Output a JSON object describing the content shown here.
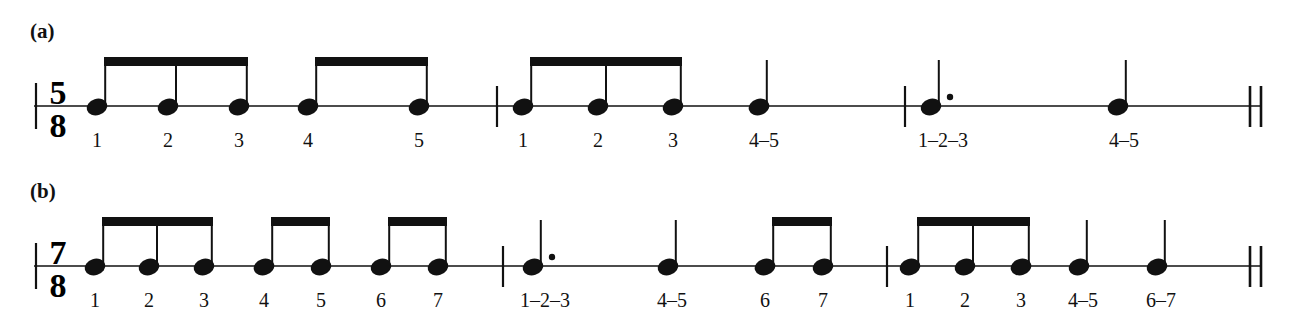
{
  "figure": {
    "background_color": "#ffffff",
    "ink_color": "#111111",
    "systems": [
      {
        "id": "a",
        "label": "(a)",
        "time_signature": {
          "numerator": "5",
          "denominator": "8"
        },
        "beat_grouping": "3+2",
        "measures": [
          {
            "index": 1,
            "notes": [
              {
                "type": "eighth",
                "beam_group": 1,
                "count_label": "1",
                "dotted": false
              },
              {
                "type": "eighth",
                "beam_group": 1,
                "count_label": "2",
                "dotted": false
              },
              {
                "type": "eighth",
                "beam_group": 1,
                "count_label": "3",
                "dotted": false
              },
              {
                "type": "eighth",
                "beam_group": 2,
                "count_label": "4",
                "dotted": false
              },
              {
                "type": "eighth",
                "beam_group": 2,
                "count_label": "5",
                "dotted": false
              }
            ]
          },
          {
            "index": 2,
            "notes": [
              {
                "type": "eighth",
                "beam_group": 3,
                "count_label": "1",
                "dotted": false
              },
              {
                "type": "eighth",
                "beam_group": 3,
                "count_label": "2",
                "dotted": false
              },
              {
                "type": "eighth",
                "beam_group": 3,
                "count_label": "3",
                "dotted": false
              },
              {
                "type": "quarter",
                "beam_group": null,
                "count_label": "4–5",
                "dotted": false
              }
            ]
          },
          {
            "index": 3,
            "notes": [
              {
                "type": "quarter",
                "beam_group": null,
                "count_label": "1–2–3",
                "dotted": true
              },
              {
                "type": "quarter",
                "beam_group": null,
                "count_label": "4–5",
                "dotted": false
              }
            ]
          }
        ],
        "final_barline": "double"
      },
      {
        "id": "b",
        "label": "(b)",
        "time_signature": {
          "numerator": "7",
          "denominator": "8"
        },
        "beat_grouping": "3+2+2",
        "measures": [
          {
            "index": 1,
            "notes": [
              {
                "type": "eighth",
                "beam_group": 1,
                "count_label": "1",
                "dotted": false
              },
              {
                "type": "eighth",
                "beam_group": 1,
                "count_label": "2",
                "dotted": false
              },
              {
                "type": "eighth",
                "beam_group": 1,
                "count_label": "3",
                "dotted": false
              },
              {
                "type": "eighth",
                "beam_group": 2,
                "count_label": "4",
                "dotted": false
              },
              {
                "type": "eighth",
                "beam_group": 2,
                "count_label": "5",
                "dotted": false
              },
              {
                "type": "eighth",
                "beam_group": 3,
                "count_label": "6",
                "dotted": false
              },
              {
                "type": "eighth",
                "beam_group": 3,
                "count_label": "7",
                "dotted": false
              }
            ]
          },
          {
            "index": 2,
            "notes": [
              {
                "type": "quarter",
                "beam_group": null,
                "count_label": "1–2–3",
                "dotted": true
              },
              {
                "type": "quarter",
                "beam_group": null,
                "count_label": "4–5",
                "dotted": false
              },
              {
                "type": "eighth",
                "beam_group": 4,
                "count_label": "6",
                "dotted": false
              },
              {
                "type": "eighth",
                "beam_group": 4,
                "count_label": "7",
                "dotted": false
              }
            ]
          },
          {
            "index": 3,
            "notes": [
              {
                "type": "eighth",
                "beam_group": 5,
                "count_label": "1",
                "dotted": false
              },
              {
                "type": "eighth",
                "beam_group": 5,
                "count_label": "2",
                "dotted": false
              },
              {
                "type": "eighth",
                "beam_group": 5,
                "count_label": "3",
                "dotted": false
              },
              {
                "type": "quarter",
                "beam_group": null,
                "count_label": "4–5",
                "dotted": false
              },
              {
                "type": "quarter",
                "beam_group": null,
                "count_label": "6–7",
                "dotted": false
              }
            ]
          }
        ],
        "final_barline": "double"
      }
    ]
  },
  "system_a": {
    "label": "(a)",
    "ts_num": "5",
    "ts_den": "8",
    "counts": {
      "m1n1": "1",
      "m1n2": "2",
      "m1n3": "3",
      "m1n4": "4",
      "m1n5": "5",
      "m2n1": "1",
      "m2n2": "2",
      "m2n3": "3",
      "m2n4": "4–5",
      "m3n1": "1–2–3",
      "m3n2": "4–5"
    }
  },
  "system_b": {
    "label": "(b)",
    "ts_num": "7",
    "ts_den": "8",
    "counts": {
      "m1n1": "1",
      "m1n2": "2",
      "m1n3": "3",
      "m1n4": "4",
      "m1n5": "5",
      "m1n6": "6",
      "m1n7": "7",
      "m2n1": "1–2–3",
      "m2n2": "4–5",
      "m2n3": "6",
      "m2n4": "7",
      "m3n1": "1",
      "m3n2": "2",
      "m3n3": "3",
      "m3n4": "4–5",
      "m3n5": "6–7"
    }
  }
}
